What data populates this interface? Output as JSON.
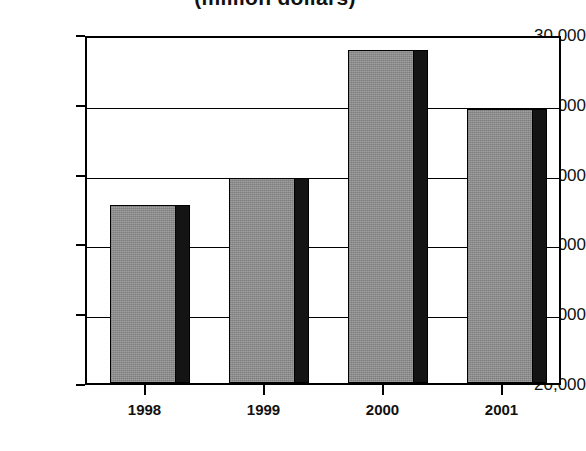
{
  "chart_data": {
    "type": "bar",
    "title": "(million dollars)",
    "xlabel": "",
    "ylabel": "",
    "categories": [
      "1998",
      "1999",
      "2000",
      "2001"
    ],
    "values": [
      25100,
      25870,
      29550,
      27850
    ],
    "series": [
      {
        "name": "",
        "values": [
          25100,
          25870,
          29550,
          27850
        ]
      }
    ],
    "ylim": [
      20000,
      30000
    ],
    "y_ticks": [
      20000,
      22000,
      24000,
      26000,
      28000,
      30000
    ],
    "y_tick_labels": [
      "20,000",
      "22,000",
      "24,000",
      "26,000",
      "28,000",
      "30,000"
    ],
    "grid": true,
    "legend": false,
    "legend_position": "none",
    "bar_fill_color": "#8c8c8c",
    "bar_shadow_color": "#141414",
    "axis_color": "#000000",
    "background_color": "#ffffff"
  }
}
